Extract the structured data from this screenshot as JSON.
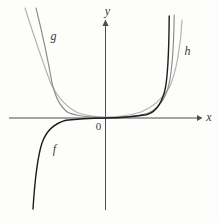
{
  "figure": {
    "background": "#fdfdfc",
    "text_color": "#3a3a3a",
    "axes": {
      "color": "#4d4d4d",
      "x_axis": {
        "path": "M 9 118 L 197.5 118",
        "arrow": "M 197 114.9 L 202.5 118 L 197 121.1 Z",
        "label": "x",
        "label_x": 209,
        "label_y": 120.5
      },
      "y_axis": {
        "path": "M 105.5 22.5 L 105.5 210",
        "arrow": "M 102.4 26 L 105.5 19.5 L 108.6 26 Z",
        "label": "y",
        "label_x": 107.5,
        "label_y": 15
      },
      "origin_label": "0",
      "origin_label_x": 98.5,
      "origin_label_y": 129.5
    },
    "curves": [
      {
        "name": "f",
        "label": "f",
        "color": "#1c1c1c",
        "label_x": 54.5,
        "label_y": 153,
        "path": "M 33 209 C 34.5 185 36.5 160 42 143 C 46.5 130 54 123.5 66 120.3 C 78 118.9 92 118.3 105.5 118.05 C 120 117.8 134 116.8 146 114.8 C 156 112.8 161 104 164.5 92 C 168 79 169 45 169.2 16"
      },
      {
        "name": "g",
        "label": "g",
        "color": "#8c8c8c",
        "label_x": 53.5,
        "label_y": 40,
        "path": "M 36 8 C 41 28 47.5 57 52 83 C 55 96 59 106 68 112.5 C 77 116.3 90 117.4 105.5 117.5 C 122 117.5 136 116.5 147 113.5 C 156 110.3 163 102.5 167.5 90 C 172 76 173.8 42 174.2 15"
      },
      {
        "name": "h",
        "label": "h",
        "color": "#b2b2b2",
        "label_x": 187.5,
        "label_y": 55,
        "path": "M 25 8 C 32 30 42 60 51 84 C 58 98 66 107 77 112.5 C 87 116 96 117 105.5 117.1 C 118 117.1 130 115.5 141 112 C 152 107.5 162 99.5 169 88 C 176 74 181 45 182 20"
      }
    ]
  },
  "chart_data": {
    "type": "line",
    "title": "",
    "xlabel": "x",
    "ylabel": "y",
    "origin_label": "0",
    "axes_numeric": false,
    "grid": false,
    "legend_position": "labels-on-curves",
    "series": [
      {
        "name": "f",
        "parity": "odd",
        "color": "#1c1c1c",
        "sample_points_px": [
          [
            33,
            209
          ],
          [
            42,
            143
          ],
          [
            66,
            120
          ],
          [
            105.5,
            118
          ],
          [
            146,
            115
          ],
          [
            164.5,
            92
          ],
          [
            169,
            16
          ]
        ]
      },
      {
        "name": "g",
        "parity": "even",
        "color": "#8c8c8c",
        "sample_points_px": [
          [
            36,
            8
          ],
          [
            52,
            83
          ],
          [
            68,
            112
          ],
          [
            105.5,
            117.5
          ],
          [
            147,
            113.5
          ],
          [
            167.5,
            90
          ],
          [
            174,
            15
          ]
        ]
      },
      {
        "name": "h",
        "parity": "even",
        "color": "#b2b2b2",
        "sample_points_px": [
          [
            25,
            8
          ],
          [
            51,
            84
          ],
          [
            77,
            112.5
          ],
          [
            105.5,
            117
          ],
          [
            141,
            112
          ],
          [
            169,
            88
          ],
          [
            182,
            20
          ]
        ]
      }
    ],
    "axis_origin_px": [
      105.5,
      118
    ]
  }
}
